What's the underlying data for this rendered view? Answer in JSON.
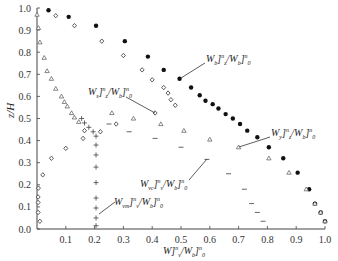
{
  "chart_data": {
    "type": "scatter",
    "title": "",
    "xlabel": "W]_v^n / W_b]_0^n",
    "ylabel": "z/H",
    "xlim": [
      0,
      1.0
    ],
    "ylim": [
      0,
      1.0
    ],
    "x_ticks": [
      "0.1",
      "0.2",
      "0.3",
      "0.4",
      "0.5",
      "0.6",
      "0.7",
      "0.8",
      "0.9",
      "1.0"
    ],
    "y_ticks": [
      "0.0",
      "0.1",
      "0.2",
      "0.3",
      "0.4",
      "0.5",
      "0.6",
      "0.7",
      "0.8",
      "0.9",
      "1.0"
    ],
    "grid": false,
    "series": [
      {
        "name": "W_b]_z^n/W_b]_0^n",
        "marker": "filled-circle",
        "points": [
          [
            0.04,
            0.99
          ],
          [
            0.11,
            0.96
          ],
          [
            0.205,
            0.92
          ],
          [
            0.305,
            0.85
          ],
          [
            0.385,
            0.78
          ],
          [
            0.44,
            0.72
          ],
          [
            0.495,
            0.68
          ],
          [
            0.535,
            0.64
          ],
          [
            0.565,
            0.605
          ],
          [
            0.585,
            0.58
          ],
          [
            0.61,
            0.565
          ],
          [
            0.63,
            0.545
          ],
          [
            0.655,
            0.52
          ],
          [
            0.68,
            0.5
          ],
          [
            0.705,
            0.475
          ],
          [
            0.73,
            0.445
          ],
          [
            0.765,
            0.415
          ],
          [
            0.805,
            0.37
          ],
          [
            0.855,
            0.32
          ],
          [
            0.905,
            0.255
          ],
          [
            0.945,
            0.18
          ],
          [
            0.965,
            0.115
          ],
          [
            0.985,
            0.075
          ],
          [
            1.0,
            0.035
          ]
        ]
      },
      {
        "name": "W_s]_z^n/W_s]_0^n",
        "marker": "open-diamond",
        "points": [
          [
            0.065,
            0.965
          ],
          [
            0.13,
            0.92
          ],
          [
            0.225,
            0.85
          ],
          [
            0.3,
            0.785
          ],
          [
            0.365,
            0.72
          ],
          [
            0.4,
            0.675
          ],
          [
            0.44,
            0.64
          ],
          [
            0.455,
            0.615
          ],
          [
            0.465,
            0.585
          ],
          [
            0.48,
            0.56
          ],
          [
            0.41,
            0.525
          ],
          [
            0.275,
            0.475
          ],
          [
            0.22,
            0.44
          ],
          [
            0.165,
            0.445
          ],
          [
            0.16,
            0.41
          ],
          [
            0.1,
            0.365
          ],
          [
            0.05,
            0.32
          ],
          [
            0.02,
            0.245
          ],
          [
            0.005,
            0.185
          ],
          [
            0.004,
            0.145
          ],
          [
            0.004,
            0.12
          ],
          [
            0.004,
            0.075
          ],
          [
            0.01,
            0.035
          ]
        ]
      },
      {
        "name": "W_y]_z^n/W_b]_0^n",
        "marker": "open-triangle",
        "points": [
          [
            0.0,
            0.97
          ],
          [
            0.005,
            0.91
          ],
          [
            0.01,
            0.845
          ],
          [
            0.025,
            0.775
          ],
          [
            0.035,
            0.715
          ],
          [
            0.05,
            0.68
          ],
          [
            0.065,
            0.635
          ],
          [
            0.085,
            0.6
          ],
          [
            0.095,
            0.575
          ],
          [
            0.105,
            0.555
          ],
          [
            0.12,
            0.525
          ],
          [
            0.13,
            0.505
          ],
          [
            0.145,
            0.485
          ],
          [
            0.26,
            0.525
          ],
          [
            0.335,
            0.5
          ],
          [
            0.43,
            0.475
          ],
          [
            0.51,
            0.445
          ],
          [
            0.6,
            0.405
          ],
          [
            0.7,
            0.37
          ],
          [
            0.805,
            0.32
          ],
          [
            0.875,
            0.255
          ],
          [
            0.935,
            0.18
          ],
          [
            0.965,
            0.115
          ],
          [
            0.985,
            0.075
          ],
          [
            1.0,
            0.035
          ]
        ]
      },
      {
        "name": "W_vc]_v^n/W_b]_0^n",
        "marker": "dash",
        "points": [
          [
            0.25,
            0.475
          ],
          [
            0.32,
            0.44
          ],
          [
            0.41,
            0.41
          ],
          [
            0.5,
            0.37
          ],
          [
            0.59,
            0.315
          ],
          [
            0.665,
            0.25
          ],
          [
            0.72,
            0.18
          ],
          [
            0.745,
            0.115
          ],
          [
            0.765,
            0.075
          ],
          [
            0.785,
            0.035
          ]
        ]
      },
      {
        "name": "W_vm]_v^n/W_b]_0^n",
        "marker": "plus",
        "points": [
          [
            0.155,
            0.5
          ],
          [
            0.165,
            0.48
          ],
          [
            0.18,
            0.46
          ],
          [
            0.195,
            0.44
          ],
          [
            0.205,
            0.42
          ],
          [
            0.205,
            0.38
          ],
          [
            0.205,
            0.335
          ],
          [
            0.205,
            0.28
          ],
          [
            0.205,
            0.21
          ],
          [
            0.205,
            0.14
          ],
          [
            0.205,
            0.095
          ],
          [
            0.205,
            0.05
          ],
          [
            0.205,
            0.015
          ]
        ]
      }
    ],
    "annotations": [
      {
        "text_main": "W",
        "sub1": "b",
        "sup": "n",
        "sub2": "z",
        "den_sub": "b",
        "den_sup": "n",
        "den_sub2": "0"
      },
      {
        "text_main": "W",
        "sub1": "s",
        "sup": "n",
        "sub2": "z",
        "den_sub": "b",
        "den_sup": "n",
        "den_sub2": "0"
      },
      {
        "text_main": "W",
        "sub1": "y",
        "sup": "n",
        "sub2": "z",
        "den_sub": "b",
        "den_sup": "n",
        "den_sub2": "0"
      },
      {
        "text_main": "W",
        "sub1": "vc",
        "sup": "n",
        "sub2": "v",
        "den_sub": "b",
        "den_sup": "n",
        "den_sub2": "0"
      },
      {
        "text_main": "W",
        "sub1": "vm",
        "sup": "n",
        "sub2": "v",
        "den_sub": "b",
        "den_sup": "n",
        "den_sub2": "0"
      }
    ]
  },
  "labels": {
    "y_axis": "z/H",
    "x_axis_main": "W]",
    "x_axis_sub": "v",
    "x_axis_sup": "n",
    "x_axis_den": "/W",
    "x_axis_den_sub": "b",
    "x_axis_den_tail": "]",
    "x_axis_den_sub2": "0",
    "x_axis_den_sup": "n",
    "curve_b": {
      "w": "W",
      "s1": "b",
      "br": "]",
      "sup": "n",
      "sub": "z",
      "den": "/W",
      "ds": "b",
      "dbr": "]",
      "dsup": "n",
      "dsub": "0"
    },
    "curve_s": {
      "w": "W",
      "s1": "s",
      "br": "]",
      "sup": "n",
      "sub": "z",
      "den": "/W",
      "ds": "b",
      "dbr": "]",
      "dsup": "n",
      "dsub": "0"
    },
    "curve_y": {
      "w": "W",
      "s1": "y",
      "br": "]",
      "sup": "n",
      "sub": "z",
      "den": "/W",
      "ds": "b",
      "dbr": "]",
      "dsup": "n",
      "dsub": "0"
    },
    "curve_vc": {
      "w": "W",
      "s1": "vc",
      "br": "]",
      "sup": "n",
      "sub": "v",
      "den": "/W",
      "ds": "b",
      "dbr": "]",
      "dsup": "n",
      "dsub": "0"
    },
    "curve_vm": {
      "w": "W",
      "s1": "vm",
      "br": "]",
      "sup": "n",
      "sub": "v",
      "den": "/W",
      "ds": "b",
      "dbr": "]",
      "dsup": "n",
      "dsub": "0"
    }
  }
}
